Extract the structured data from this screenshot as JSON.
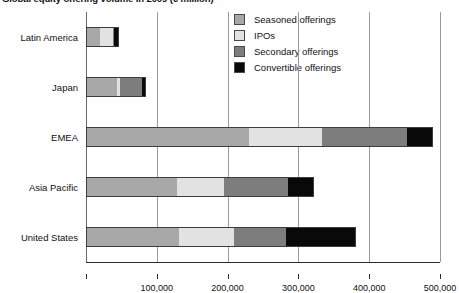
{
  "chart_data": {
    "type": "bar",
    "orientation": "horizontal",
    "stacked": true,
    "title": "Global equity offering volume in 2009 (€ million)",
    "xlabel": "",
    "ylabel": "",
    "xlim": [
      0,
      500000
    ],
    "grid": true,
    "legend_position": "top-right",
    "categories": [
      "Latin America",
      "Japan",
      "EMEA",
      "Asia Pacific",
      "United States"
    ],
    "series": [
      {
        "name": "Seasoned offerings",
        "color": "#a8a8a8",
        "values": [
          20000,
          44000,
          230000,
          128000,
          131000
        ]
      },
      {
        "name": "IPOs",
        "color": "#e2e2e2",
        "values": [
          18000,
          4000,
          103000,
          67000,
          78000
        ]
      },
      {
        "name": "Secondary offerings",
        "color": "#7d7d7d",
        "values": [
          2000,
          31000,
          121000,
          90000,
          73000
        ]
      },
      {
        "name": "Convertible offerings",
        "color": "#090909",
        "values": [
          6000,
          6000,
          36000,
          37000,
          99000
        ]
      }
    ],
    "totals": [
      46000,
      85000,
      490000,
      322000,
      381000
    ],
    "xticks": [
      100000,
      200000,
      300000,
      400000,
      500000
    ],
    "xtick_labels": [
      "100,000",
      "200,000",
      "300,000",
      "400,000",
      "500,000"
    ]
  },
  "legend": {
    "items": [
      {
        "label": "Seasoned offerings",
        "swatch": "legend-swatch-seasoned"
      },
      {
        "label": "IPOs",
        "swatch": "legend-swatch-ipos"
      },
      {
        "label": "Secondary offerings",
        "swatch": "legend-swatch-secondary"
      },
      {
        "label": "Convertible offerings",
        "swatch": "legend-swatch-convertible"
      }
    ]
  }
}
